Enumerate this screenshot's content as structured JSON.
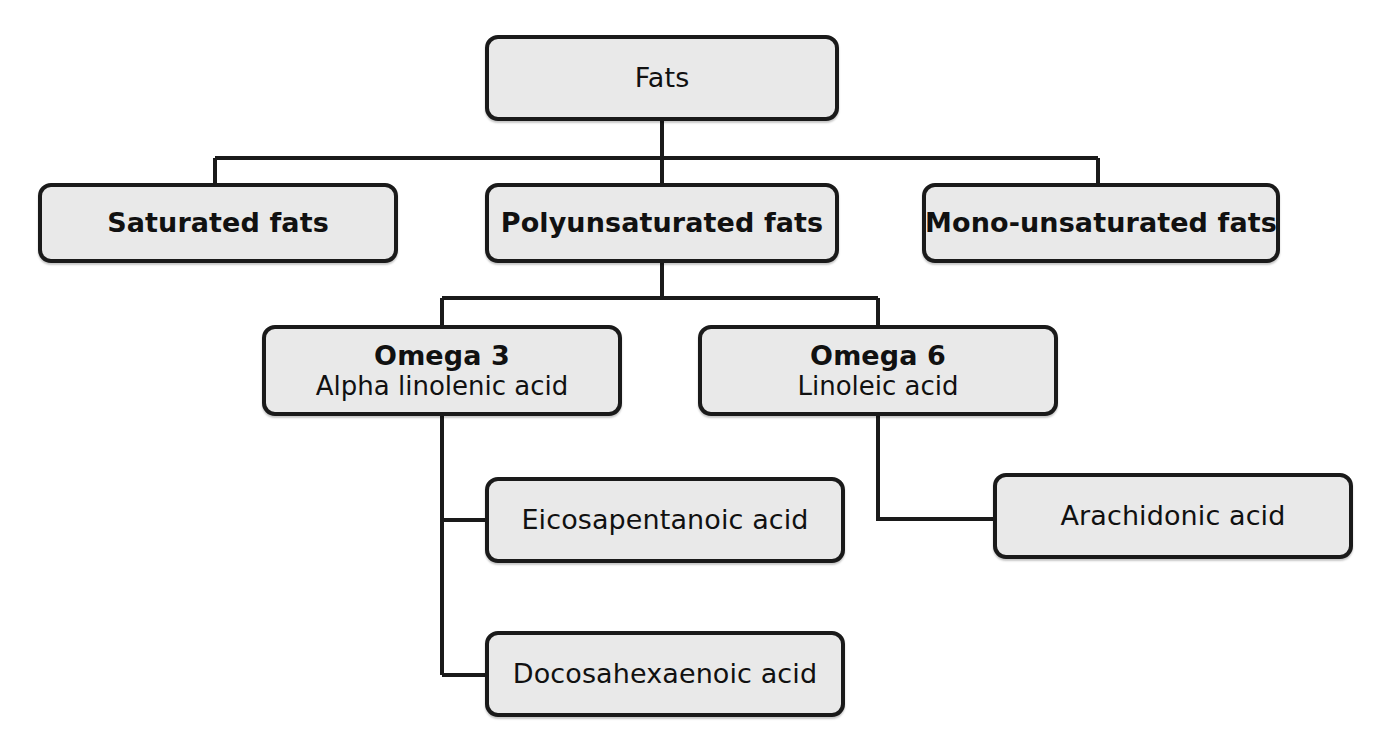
{
  "diagram": {
    "palette": {
      "node_fill": "#e9e9e9",
      "node_border": "#1a1a1a",
      "connector": "#1a1a1a",
      "background": "#ffffff",
      "text": "#111111"
    },
    "nodes": {
      "fats": {
        "label": "Fats",
        "weight": "regular"
      },
      "saturated": {
        "label": "Saturated fats",
        "weight": "bold"
      },
      "polyunsaturated": {
        "label": "Polyunsaturated fats",
        "weight": "bold"
      },
      "monounsaturated": {
        "label": "Mono-unsaturated fats",
        "weight": "bold"
      },
      "omega3": {
        "label": "Omega 3",
        "sublabel": "Alpha linolenic acid",
        "weight": "bold"
      },
      "omega6": {
        "label": "Omega 6",
        "sublabel": "Linoleic acid",
        "weight": "bold"
      },
      "eicosapentanoic": {
        "label": "Eicosapentanoic acid",
        "weight": "regular"
      },
      "docosahexaenoic": {
        "label": "Docosahexaenoic acid",
        "weight": "regular"
      },
      "arachidonic": {
        "label": "Arachidonic acid",
        "weight": "regular"
      }
    },
    "edges": [
      {
        "from": "fats",
        "to": "saturated"
      },
      {
        "from": "fats",
        "to": "polyunsaturated"
      },
      {
        "from": "fats",
        "to": "monounsaturated"
      },
      {
        "from": "polyunsaturated",
        "to": "omega3"
      },
      {
        "from": "polyunsaturated",
        "to": "omega6"
      },
      {
        "from": "omega3",
        "to": "eicosapentanoic"
      },
      {
        "from": "omega3",
        "to": "docosahexaenoic"
      },
      {
        "from": "omega6",
        "to": "arachidonic"
      }
    ]
  }
}
